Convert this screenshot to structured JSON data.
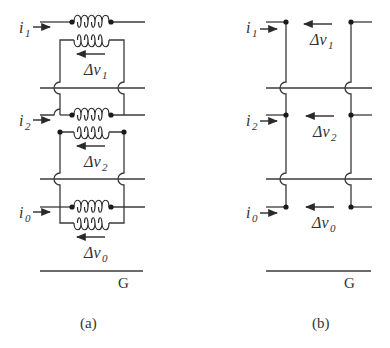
{
  "figure": {
    "panels": [
      {
        "id": "a",
        "caption": "(a)",
        "ground_label": "G",
        "phases": [
          {
            "current": "i",
            "current_sub": "1",
            "voltage": "Δv",
            "voltage_sub": "1"
          },
          {
            "current": "i",
            "current_sub": "2",
            "voltage": "Δv",
            "voltage_sub": "2"
          },
          {
            "current": "i",
            "current_sub": "0",
            "voltage": "Δv",
            "voltage_sub": "0"
          }
        ]
      },
      {
        "id": "b",
        "caption": "(b)",
        "ground_label": "G",
        "phases": [
          {
            "current": "i",
            "current_sub": "1",
            "voltage": "Δv",
            "voltage_sub": "1"
          },
          {
            "current": "i",
            "current_sub": "2",
            "voltage": "Δv",
            "voltage_sub": "2"
          },
          {
            "current": "i",
            "current_sub": "0",
            "voltage": "Δv",
            "voltage_sub": "0"
          }
        ]
      }
    ]
  }
}
